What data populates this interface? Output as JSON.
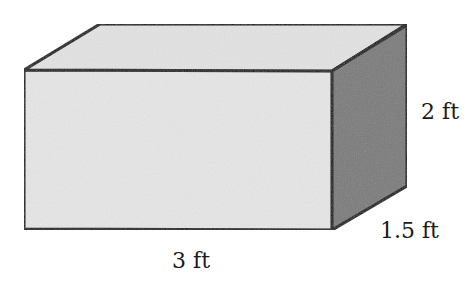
{
  "diagram": {
    "type": "rectangular-prism",
    "colors": {
      "front_face": "#e6e6e6",
      "top_face": "#e3e3e3",
      "side_face": "#7a7a7a",
      "edge": "#111111"
    },
    "labels": {
      "length": "3 ft",
      "height": "2 ft",
      "depth": "1.5 ft"
    }
  }
}
